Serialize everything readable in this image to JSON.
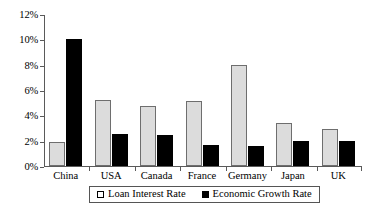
{
  "chart_data": {
    "type": "bar",
    "title": "",
    "subtitle": "",
    "xlabel": "",
    "ylabel": "",
    "categories": [
      "China",
      "USA",
      "Canada",
      "France",
      "Germany",
      "Japan",
      "UK"
    ],
    "series": [
      {
        "name": "Loan Interest Rate",
        "color": "#dcdcdc",
        "values": [
          1.9,
          5.2,
          4.75,
          5.15,
          8.0,
          3.4,
          2.95
        ]
      },
      {
        "name": "Economic Growth Rate",
        "color": "#000000",
        "values": [
          10.0,
          2.55,
          2.45,
          1.65,
          1.6,
          2.0,
          2.0
        ]
      }
    ],
    "ylim": [
      0,
      12
    ],
    "yticks": [
      0,
      2,
      4,
      6,
      8,
      10,
      12
    ],
    "ytick_labels": [
      "0%",
      "2%",
      "4%",
      "6%",
      "8%",
      "10%",
      "12%"
    ],
    "grid": false,
    "legend_position": "bottom",
    "legend": [
      {
        "label": "Loan Interest Rate",
        "marker": "hollow-square",
        "color": "#ffffff"
      },
      {
        "label": "Economic Growth Rate",
        "marker": "filled-square",
        "color": "#000000"
      }
    ],
    "annotations": []
  }
}
